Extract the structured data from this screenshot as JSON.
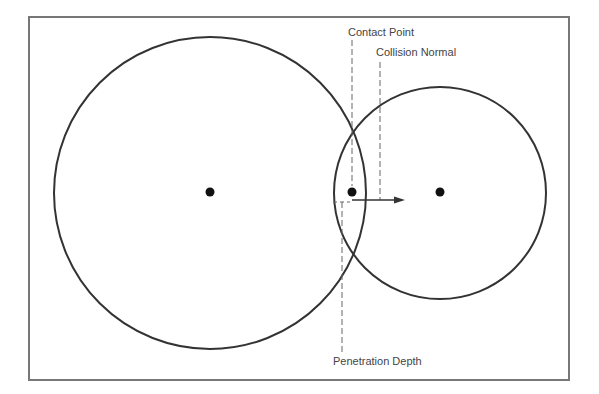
{
  "diagram": {
    "labels": {
      "contact_point": "Contact Point",
      "collision_normal": "Collision Normal",
      "penetration_depth": "Penetration Depth"
    },
    "frame": {
      "x": 29,
      "y": 17,
      "width": 540,
      "height": 363,
      "stroke": "#777777"
    },
    "circles": [
      {
        "name": "circle-a",
        "cx": 210,
        "cy": 193,
        "r": 156
      },
      {
        "name": "circle-b",
        "cx": 440,
        "cy": 193,
        "r": 106
      }
    ],
    "points": [
      {
        "name": "center-a",
        "x": 210,
        "y": 192
      },
      {
        "name": "contact-point",
        "x": 352,
        "y": 192
      },
      {
        "name": "center-b",
        "x": 440,
        "y": 192
      }
    ],
    "colors": {
      "line": "#333333",
      "dash": "#666666",
      "text": "#444444"
    }
  }
}
